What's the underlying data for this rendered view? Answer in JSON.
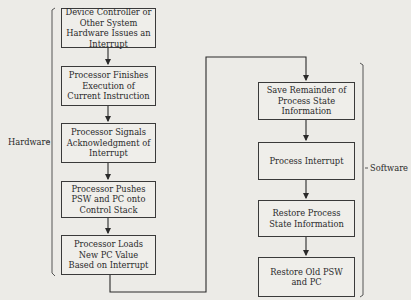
{
  "diagram": {
    "type": "flowchart",
    "groups": {
      "hardware": {
        "label": "Hardware"
      },
      "software": {
        "label": "Software"
      }
    },
    "hardware_steps": [
      {
        "id": "h1",
        "text": "Device Controller or Other System Hardware Issues an Interrupt"
      },
      {
        "id": "h2",
        "text": "Processor Finishes Execution of Current Instruction"
      },
      {
        "id": "h3",
        "text": "Processor Signals Acknowledgment of Interrupt"
      },
      {
        "id": "h4",
        "text": "Processor Pushes PSW and PC onto Control Stack"
      },
      {
        "id": "h5",
        "text": "Processor Loads New PC Value Based on Interrupt"
      }
    ],
    "software_steps": [
      {
        "id": "s1",
        "text": "Save Remainder of Process State Information"
      },
      {
        "id": "s2",
        "text": "Process Interrupt"
      },
      {
        "id": "s3",
        "text": "Restore Process State Information"
      },
      {
        "id": "s4",
        "text": "Restore Old PSW and PC"
      }
    ],
    "edges": [
      [
        "h1",
        "h2"
      ],
      [
        "h2",
        "h3"
      ],
      [
        "h3",
        "h4"
      ],
      [
        "h4",
        "h5"
      ],
      [
        "h5",
        "s1"
      ],
      [
        "s1",
        "s2"
      ],
      [
        "s2",
        "s3"
      ],
      [
        "s3",
        "s4"
      ]
    ],
    "colors": {
      "background": "#ecebe7",
      "line": "#2a2a2a",
      "box_border": "#3a3a3a"
    }
  }
}
